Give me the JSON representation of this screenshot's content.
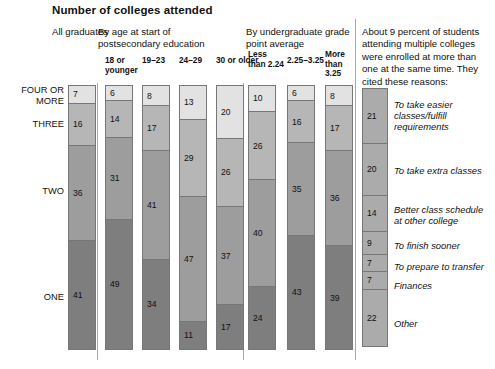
{
  "title": "Number of colleges attended",
  "groups": {
    "all": "All graduates",
    "age": "By age at start of postsecondary education",
    "gpa": "By undergraduate grade point average"
  },
  "note": "About 9 percent of students attending multiple colleges were enrolled at more than one at the same time. They cited these reasons:",
  "category_labels": {
    "four_or_more": "FOUR OR MORE",
    "three": "THREE",
    "two": "TWO",
    "one": "ONE"
  },
  "sub_headers": {
    "age_18": "18 or younger",
    "age_19_23": "19–23",
    "age_24_29": "24–29",
    "age_30": "30 or older",
    "gpa_low": "Less than 2.24",
    "gpa_mid": "2.25–3.25",
    "gpa_high": "More than 3.25"
  },
  "colors": {
    "four_or_more": "#e2e2e2",
    "three": "#b6b6b6",
    "two": "#9d9d9d",
    "one": "#7e7e7e",
    "reason_bar": "#ababab",
    "divider": "#a9a9a9"
  },
  "chart_data": {
    "type": "bar",
    "title": "Number of colleges attended",
    "orientation": "vertical-stacked",
    "stack_order_top_to_bottom": [
      "FOUR OR MORE",
      "THREE",
      "TWO",
      "ONE"
    ],
    "categories": [
      "FOUR OR MORE",
      "THREE",
      "TWO",
      "ONE"
    ],
    "unit": "percent",
    "ylim": [
      0,
      100
    ],
    "grid": false,
    "legend": "none",
    "columns": [
      {
        "group": "All graduates",
        "label": "",
        "values": [
          7,
          16,
          36,
          41
        ]
      },
      {
        "group": "By age at start of postsecondary education",
        "label": "18 or younger",
        "values": [
          6,
          14,
          31,
          49
        ]
      },
      {
        "group": "By age at start of postsecondary education",
        "label": "19–23",
        "values": [
          8,
          17,
          41,
          34
        ]
      },
      {
        "group": "By age at start of postsecondary education",
        "label": "24–29",
        "values": [
          13,
          29,
          47,
          11
        ]
      },
      {
        "group": "By age at start of postsecondary education",
        "label": "30 or older",
        "values": [
          20,
          26,
          37,
          17
        ]
      },
      {
        "group": "By undergraduate grade point average",
        "label": "Less than 2.24",
        "values": [
          10,
          26,
          40,
          24
        ]
      },
      {
        "group": "By undergraduate grade point average",
        "label": "2.25–3.25",
        "values": [
          6,
          16,
          35,
          43
        ]
      },
      {
        "group": "By undergraduate grade point average",
        "label": "More than 3.25",
        "values": [
          8,
          17,
          36,
          39
        ]
      }
    ],
    "reasons": {
      "type": "bar",
      "title": "Reasons cited for enrolling at more than one college at the same time",
      "unit": "percent",
      "items": [
        {
          "value": 21,
          "label": "To take easier classes/fulfill requirements"
        },
        {
          "value": 20,
          "label": "To take extra classes"
        },
        {
          "value": 14,
          "label": "Better class schedule at other college"
        },
        {
          "value": 9,
          "label": "To finish sooner"
        },
        {
          "value": 7,
          "label": "To prepare to transfer"
        },
        {
          "value": 7,
          "label": "Finances"
        },
        {
          "value": 22,
          "label": "Other"
        }
      ]
    }
  }
}
